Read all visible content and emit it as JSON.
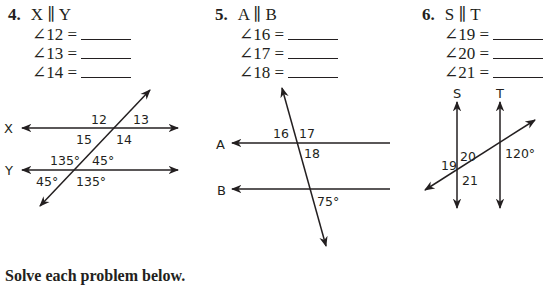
{
  "problems": [
    {
      "number": "4.",
      "relation": "X ∥ Y",
      "angles": [
        {
          "label": "∠12 =",
          "answer": ""
        },
        {
          "label": "∠13 =",
          "answer": ""
        },
        {
          "label": "∠14 =",
          "answer": ""
        }
      ],
      "diagram": {
        "lines": [
          "X",
          "Y"
        ],
        "angle_labels": [
          "12",
          "13",
          "15",
          "14",
          "135°",
          "45°",
          "45°",
          "135°"
        ]
      }
    },
    {
      "number": "5.",
      "relation": "A ∥ B",
      "angles": [
        {
          "label": "∠16 =",
          "answer": ""
        },
        {
          "label": "∠17 =",
          "answer": ""
        },
        {
          "label": "∠18 =",
          "answer": ""
        }
      ],
      "diagram": {
        "lines": [
          "A",
          "B"
        ],
        "angle_labels": [
          "16",
          "17",
          "18",
          "75°"
        ]
      }
    },
    {
      "number": "6.",
      "relation": "S ∥ T",
      "angles": [
        {
          "label": "∠19 =",
          "answer": ""
        },
        {
          "label": "∠20 =",
          "answer": ""
        },
        {
          "label": "∠21 =",
          "answer": ""
        }
      ],
      "diagram": {
        "lines": [
          "S",
          "T"
        ],
        "angle_labels": [
          "19",
          "20",
          "21",
          "120°"
        ]
      }
    }
  ],
  "footer": {
    "instruction": "Solve each problem below."
  },
  "colors": {
    "ink": "#231f20",
    "background": "#ffffff"
  }
}
